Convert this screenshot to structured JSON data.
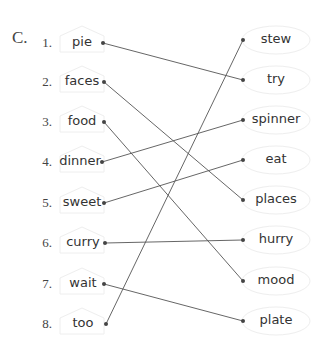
{
  "section": "C.",
  "left_items": [
    {
      "number": "1.",
      "word": "pie"
    },
    {
      "number": "2.",
      "word": "faces"
    },
    {
      "number": "3.",
      "word": "food"
    },
    {
      "number": "4.",
      "word": "dinner"
    },
    {
      "number": "5.",
      "word": "sweet"
    },
    {
      "number": "6.",
      "word": "curry"
    },
    {
      "number": "7.",
      "word": "wait"
    },
    {
      "number": "8.",
      "word": "too"
    }
  ],
  "right_items": [
    "stew",
    "try",
    "spinner",
    "eat",
    "places",
    "hurry",
    "mood",
    "plate"
  ],
  "matches": [
    {
      "left": "pie",
      "right": "try"
    },
    {
      "left": "faces",
      "right": "places"
    },
    {
      "left": "food",
      "right": "mood"
    },
    {
      "left": "dinner",
      "right": "spinner"
    },
    {
      "left": "sweet",
      "right": "eat"
    },
    {
      "left": "curry",
      "right": "hurry"
    },
    {
      "left": "wait",
      "right": "plate"
    },
    {
      "left": "too",
      "right": "stew"
    }
  ],
  "colors": {
    "line": "#555555",
    "text": "#333333",
    "shape_outline": "#eeeeee"
  }
}
